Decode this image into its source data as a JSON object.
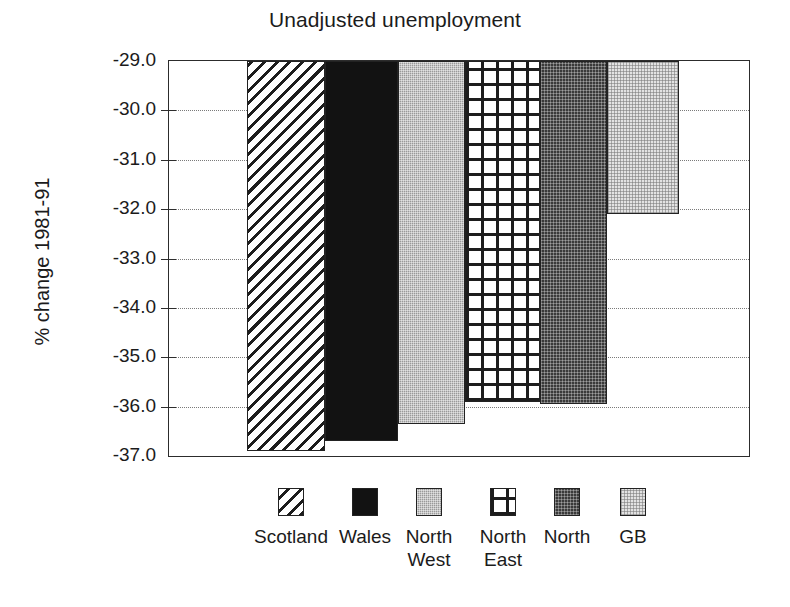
{
  "chart_data": {
    "type": "bar",
    "title": "Unadjusted unemployment",
    "xlabel": "",
    "ylabel": "% change 1981-91",
    "categories": [
      "Scotland",
      "Wales",
      "North West",
      "North East",
      "North",
      "GB"
    ],
    "values": [
      -36.9,
      -36.7,
      -36.35,
      -35.9,
      -35.95,
      -32.1
    ],
    "ylim": [
      -37.0,
      -29.0
    ],
    "ytick_labels": [
      "-29.0",
      "-30.0",
      "-31.0",
      "-32.0",
      "-33.0",
      "-34.0",
      "-35.0",
      "-36.0",
      "-37.0"
    ],
    "ytick_values": [
      -29.0,
      -30.0,
      -31.0,
      -32.0,
      -33.0,
      -34.0,
      -35.0,
      -36.0,
      -37.0
    ],
    "grid": true,
    "grid_style": "dotted",
    "legend_position": "bottom",
    "legend": [
      {
        "label": "Scotland",
        "pattern": "diagonal-hatch",
        "color": "#1d1d1d"
      },
      {
        "label": "Wales",
        "pattern": "solid-black",
        "color": "#121212"
      },
      {
        "label": "North\nWest",
        "pattern": "medium-gray-dots",
        "color": "#9a9a9a"
      },
      {
        "label": "North\nEast",
        "pattern": "crosshatch-grid",
        "color": "#1d1d1d"
      },
      {
        "label": "North",
        "pattern": "dark-gray-dots",
        "color": "#3a3a3a"
      },
      {
        "label": "GB",
        "pattern": "light-gray-dots",
        "color": "#e2e2e2"
      }
    ]
  }
}
